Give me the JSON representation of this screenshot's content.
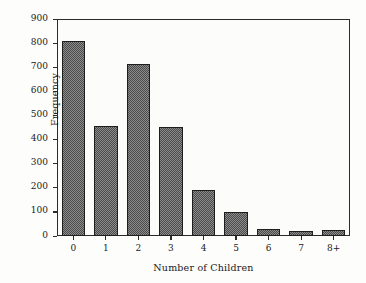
{
  "chart_data": {
    "type": "bar",
    "title": "",
    "xlabel": "Number of Children",
    "ylabel": "Frequency",
    "categories": [
      "0",
      "1",
      "2",
      "3",
      "4",
      "5",
      "6",
      "7",
      "8+"
    ],
    "values": [
      807,
      456,
      713,
      452,
      190,
      99,
      29,
      21,
      24
    ],
    "ylim": [
      0,
      900
    ],
    "yticks": [
      0,
      100,
      200,
      300,
      400,
      500,
      600,
      700,
      800,
      900
    ],
    "ytick_labels": [
      "0",
      "100",
      "200",
      "300",
      "400",
      "500",
      "600",
      "700",
      "800",
      "900"
    ],
    "grid": false,
    "legend": null,
    "bar_fill_color": "#6e6e6e",
    "bar_edge_color": "#1e1e1e",
    "plot_background": "#fcfcfa",
    "axis_color": "#2b2b2b",
    "text_color": "#1a1a1a"
  }
}
